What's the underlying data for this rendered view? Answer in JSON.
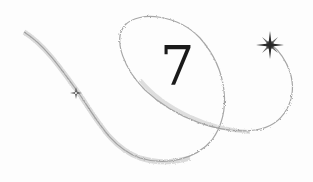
{
  "numeral": "7",
  "colors": {
    "numeral": "#1a1a1a",
    "trail": "#8a8a8a",
    "star": "#2a2a2a",
    "background": "#fdfdfd"
  },
  "icons": [
    "sparkle-star-icon",
    "swirl-trail"
  ]
}
